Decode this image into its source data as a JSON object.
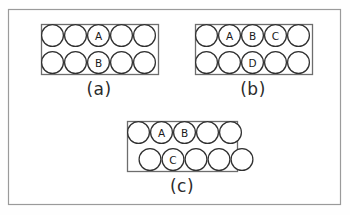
{
  "figure": {
    "background_color": "#fefefe",
    "frame_color": "#9a9a9a",
    "circle_stroke_color": "#303030",
    "circle_fill_color": "#ffffff",
    "label_color": "#1a1a1a"
  },
  "panels": [
    {
      "id": "panel-a",
      "caption": "(a)",
      "packing": "square",
      "rows": 2,
      "columns": 5,
      "circle_diameter": 23,
      "box": {
        "x": 41,
        "y": 24,
        "width": 117,
        "height": 50
      },
      "labels": [
        {
          "text": "A",
          "row": 0,
          "column": 2
        },
        {
          "text": "B",
          "row": 1,
          "column": 2
        }
      ]
    },
    {
      "id": "panel-b",
      "caption": "(b)",
      "packing": "square",
      "rows": 2,
      "columns": 5,
      "circle_diameter": 23,
      "box": {
        "x": 195,
        "y": 24,
        "width": 117,
        "height": 50
      },
      "labels": [
        {
          "text": "A",
          "row": 0,
          "column": 1
        },
        {
          "text": "B",
          "row": 0,
          "column": 2
        },
        {
          "text": "C",
          "row": 0,
          "column": 3
        },
        {
          "text": "D",
          "row": 1,
          "column": 2
        }
      ]
    },
    {
      "id": "panel-c",
      "caption": "(c)",
      "packing": "hexagonal",
      "rows": 2,
      "columns": 5,
      "circle_diameter": 23,
      "row_offset": 11.5,
      "box": {
        "x": 127,
        "y": 121,
        "width": 110,
        "height": 50
      },
      "labels": [
        {
          "text": "A",
          "row": 0,
          "column": 1
        },
        {
          "text": "B",
          "row": 0,
          "column": 2
        },
        {
          "text": "C",
          "row": 1,
          "column": 1
        }
      ]
    }
  ],
  "captions": {
    "a": "(a)",
    "b": "(b)",
    "c": "(c)"
  }
}
